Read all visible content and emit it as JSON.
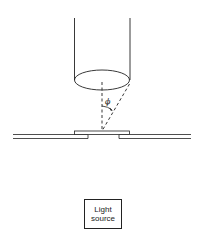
{
  "diagram": {
    "title": "",
    "angle_label": "ϕ",
    "light_source": {
      "line1": "Light",
      "line2": "source"
    },
    "colors": {
      "stroke": "#222222",
      "background": "#ffffff"
    }
  }
}
